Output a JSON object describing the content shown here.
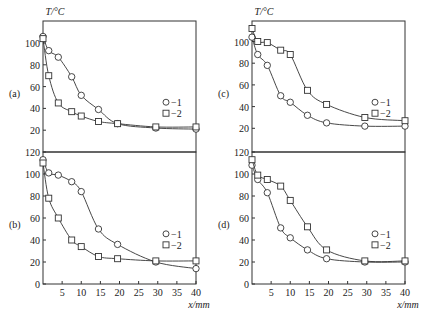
{
  "figure": {
    "ylabel": "T/°C",
    "xlabel": "x/mm",
    "legend": [
      "−1",
      "−2"
    ]
  },
  "chart_data": [
    {
      "type": "line",
      "panel": "(a)",
      "ylabel": "T/°C",
      "xlabel": "",
      "xlim": [
        0,
        40
      ],
      "ylim": [
        0,
        120
      ],
      "yticks": [
        20,
        40,
        60,
        80,
        100
      ],
      "legend": [
        "−1",
        "−2"
      ],
      "series": [
        {
          "name": "1",
          "marker": "circle",
          "x": [
            0,
            1.5,
            4,
            7.5,
            10,
            14.5,
            19.5,
            29.5,
            40
          ],
          "y": [
            106,
            93,
            87,
            69,
            52,
            39,
            26,
            22,
            21
          ]
        },
        {
          "name": "2",
          "marker": "square",
          "x": [
            0,
            1.5,
            4,
            7.5,
            10,
            14.5,
            19.5,
            29.5,
            40
          ],
          "y": [
            104,
            70,
            45,
            37,
            33,
            28,
            26,
            23,
            23
          ]
        }
      ]
    },
    {
      "type": "line",
      "panel": "(c)",
      "ylabel": "T/°C",
      "xlabel": "",
      "xlim": [
        0,
        40
      ],
      "ylim": [
        0,
        120
      ],
      "yticks": [
        20,
        40,
        60,
        80,
        100,
        120
      ],
      "legend": [
        "−1",
        "−2"
      ],
      "series": [
        {
          "name": "1",
          "marker": "circle",
          "x": [
            0,
            1.5,
            4,
            7.5,
            10,
            14.5,
            19.5,
            29.5,
            40
          ],
          "y": [
            104,
            88,
            78,
            50,
            44,
            32,
            25,
            22,
            22
          ]
        },
        {
          "name": "2",
          "marker": "square",
          "x": [
            0,
            1.5,
            4,
            7.5,
            10,
            14.5,
            19.5,
            29.5,
            40
          ],
          "y": [
            112,
            100,
            99,
            92,
            88,
            55,
            42,
            30,
            27
          ]
        }
      ]
    },
    {
      "type": "line",
      "panel": "(b)",
      "ylabel": "",
      "xlabel": "x/mm",
      "xlim": [
        0,
        40
      ],
      "ylim": [
        0,
        120
      ],
      "yticks": [
        0,
        20,
        40,
        60,
        80,
        100,
        120
      ],
      "xticks": [
        5,
        10,
        15,
        20,
        25,
        30,
        35,
        40
      ],
      "legend": [
        "−1",
        "−2"
      ],
      "series": [
        {
          "name": "1",
          "marker": "circle",
          "x": [
            0,
            1.5,
            4,
            7.5,
            10,
            14.5,
            19.5,
            29.5,
            40
          ],
          "y": [
            113,
            101,
            99,
            93,
            84,
            50,
            36,
            20,
            14
          ]
        },
        {
          "name": "2",
          "marker": "square",
          "x": [
            0,
            1.5,
            4,
            7.5,
            10,
            14.5,
            19.5,
            29.5,
            40
          ],
          "y": [
            110,
            78,
            60,
            40,
            34,
            25,
            23,
            21,
            21
          ]
        }
      ]
    },
    {
      "type": "line",
      "panel": "(d)",
      "ylabel": "",
      "xlabel": "x/mm",
      "xlim": [
        0,
        40
      ],
      "ylim": [
        0,
        120
      ],
      "yticks": [
        0,
        20,
        40,
        60,
        80,
        100,
        120
      ],
      "xticks": [
        5,
        10,
        15,
        20,
        25,
        30,
        35,
        40
      ],
      "legend": [
        "−1",
        "−2"
      ],
      "series": [
        {
          "name": "1",
          "marker": "circle",
          "x": [
            0,
            1.5,
            4,
            7.5,
            10,
            14.5,
            19.5,
            29.5,
            40
          ],
          "y": [
            108,
            95,
            83,
            51,
            42,
            31,
            23,
            20,
            20
          ]
        },
        {
          "name": "2",
          "marker": "square",
          "x": [
            0,
            1.5,
            4,
            7.5,
            10,
            14.5,
            19.5,
            29.5,
            40
          ],
          "y": [
            113,
            99,
            95,
            89,
            76,
            52,
            31,
            21,
            21
          ]
        }
      ]
    }
  ]
}
